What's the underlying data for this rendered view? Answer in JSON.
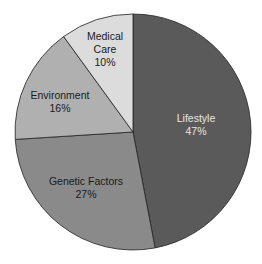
{
  "chart_data": {
    "type": "pie",
    "title": "",
    "start_angle_deg": 0,
    "direction": "clockwise",
    "slices": [
      {
        "label": "Lifestyle",
        "value": 47,
        "display": "47%",
        "color": "#5a5a5a",
        "text_color": "#e6e6e6"
      },
      {
        "label": "Genetic Factors",
        "value": 27,
        "display": "27%",
        "color": "#8a8a8a",
        "text_color": "#1a1a1a"
      },
      {
        "label": "Environment",
        "value": 16,
        "display": "16%",
        "color": "#b0b0b0",
        "text_color": "#1a1a1a"
      },
      {
        "label": "Medical Care",
        "value": 10,
        "display": "10%",
        "color": "#dcdcdc",
        "text_color": "#1a1a1a"
      }
    ],
    "legend": null
  },
  "labels": {
    "lifestyle": {
      "name": "Lifestyle",
      "pct": "47%"
    },
    "genetic": {
      "name": "Genetic Factors",
      "pct": "27%"
    },
    "environment": {
      "name": "Environment",
      "pct": "16%"
    },
    "medical_line1": "Medical",
    "medical_line2": "Care",
    "medical_pct": "10%"
  }
}
